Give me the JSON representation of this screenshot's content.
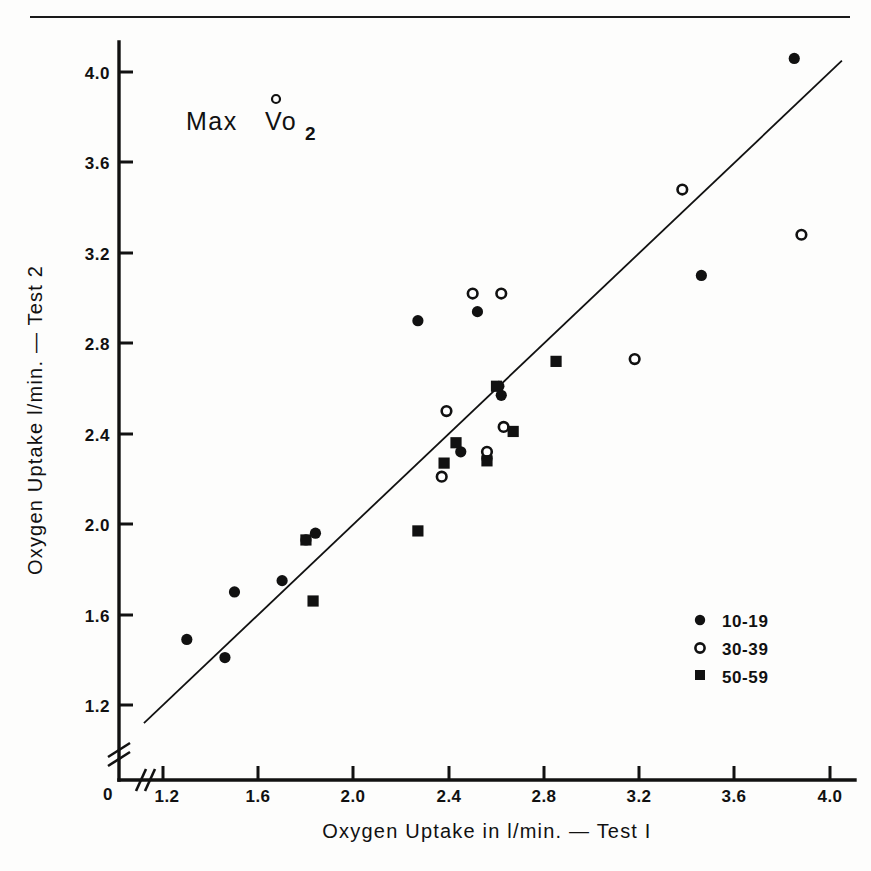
{
  "figure": {
    "title_parts": {
      "main": "Max",
      "symbol": "Vo",
      "subscript": "2"
    },
    "background_color": "#fdfdfc",
    "ink_color": "#111111"
  },
  "chart_data": {
    "type": "scatter",
    "xlabel": "Oxygen Uptake in l/min. — Test I",
    "ylabel": "Oxygen Uptake l/min. — Test 2",
    "xlim": [
      1.08,
      4.12
    ],
    "ylim": [
      1.08,
      4.16
    ],
    "xticks": [
      1.2,
      1.6,
      2.0,
      2.4,
      2.8,
      3.2,
      3.6,
      4.0
    ],
    "xtick_labels": [
      "1.2",
      "1.6",
      "2.0",
      "2.4",
      "2.8",
      "3.2",
      "3.6",
      "4.0"
    ],
    "yticks": [
      1.2,
      1.6,
      2.0,
      2.4,
      2.8,
      3.2,
      3.6,
      4.0
    ],
    "ytick_labels": [
      "1.2",
      "1.6",
      "2.0",
      "2.4",
      "2.8",
      "3.2",
      "3.6",
      "4.0"
    ],
    "origin_label": "0",
    "axis_break": true,
    "grid": false,
    "legend_position": "lower-right",
    "reference_line": {
      "name": "identity-line",
      "type": "line",
      "x": [
        1.12,
        4.05
      ],
      "y": [
        1.12,
        4.05
      ],
      "note": "line of identity (y = x)"
    },
    "series": [
      {
        "name": "10-19",
        "marker": "filled-circle",
        "color": "#111111",
        "points": [
          [
            1.3,
            1.49
          ],
          [
            1.46,
            1.41
          ],
          [
            1.5,
            1.7
          ],
          [
            1.7,
            1.75
          ],
          [
            1.8,
            1.93
          ],
          [
            1.84,
            1.96
          ],
          [
            2.27,
            2.9
          ],
          [
            2.45,
            2.32
          ],
          [
            2.52,
            2.94
          ],
          [
            2.56,
            2.29
          ],
          [
            2.62,
            2.57
          ],
          [
            2.61,
            2.61
          ],
          [
            3.46,
            3.1
          ],
          [
            3.85,
            4.06
          ]
        ]
      },
      {
        "name": "30-39",
        "marker": "open-circle",
        "color": "#111111",
        "points": [
          [
            2.37,
            2.21
          ],
          [
            2.39,
            2.5
          ],
          [
            2.5,
            3.02
          ],
          [
            2.56,
            2.32
          ],
          [
            2.62,
            3.02
          ],
          [
            2.63,
            2.43
          ],
          [
            3.18,
            2.73
          ],
          [
            3.38,
            3.48
          ],
          [
            3.88,
            3.28
          ]
        ]
      },
      {
        "name": "50-59",
        "marker": "filled-square",
        "color": "#111111",
        "points": [
          [
            1.83,
            1.66
          ],
          [
            1.8,
            1.93
          ],
          [
            2.27,
            1.97
          ],
          [
            2.38,
            2.27
          ],
          [
            2.43,
            2.36
          ],
          [
            2.56,
            2.28
          ],
          [
            2.6,
            2.61
          ],
          [
            2.67,
            2.41
          ],
          [
            2.85,
            2.72
          ]
        ]
      }
    ]
  },
  "legend": {
    "name": "age-group-legend",
    "entries": [
      {
        "label": "10-19",
        "marker": "filled-circle"
      },
      {
        "label": "30-39",
        "marker": "open-circle"
      },
      {
        "label": "50-59",
        "marker": "filled-square"
      }
    ]
  },
  "axes": {
    "x_title": "Oxygen Uptake in l/min. — Test I",
    "y_title": "Oxygen Uptake l/min. — Test 2",
    "origin_label": "0"
  }
}
